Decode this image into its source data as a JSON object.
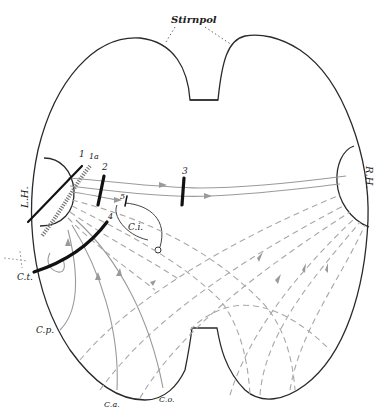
{
  "figure": {
    "title_label": "Stirnpol",
    "hemisphere_labels": {
      "left": "L.H.",
      "right": "R.H."
    },
    "cut_labels": {
      "cut_1": "1",
      "cut_1a": "1a",
      "cut_2": "2",
      "cut_3": "3",
      "cut_4": "4",
      "cut_5": "5"
    },
    "region_labels": {
      "ci": "C.i.",
      "ct": "C.t.",
      "cp": "C.p.",
      "ca": "C.a.",
      "co": "C.o."
    },
    "colors": {
      "outline": "#2a2a2a",
      "fiber": "#9a9a9a",
      "dashed_fiber": "#a8a8a8",
      "cut": "#111111"
    }
  }
}
